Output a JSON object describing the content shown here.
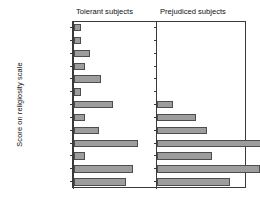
{
  "figure": {
    "ylabel": "Score on religiosity scale",
    "panels": [
      {
        "name": "tolerant",
        "title": "Tolerant subjects"
      },
      {
        "name": "prejudiced",
        "title": "Prejudiced subjects"
      }
    ],
    "bar_fill": "#9d9d9d",
    "bar_edge": "#4d4d4d",
    "frame_color": "#3a3a3a"
  },
  "chart_data": {
    "type": "bar",
    "orientation": "horizontal",
    "title": "",
    "subtitle": "",
    "xlabel": "",
    "ylabel": "Score on religiosity scale",
    "grid": false,
    "legend": "none",
    "layout": "two side-by-side panels sharing one y axis, bars extend rightward from each panel baseline",
    "categories": [
      "-19/-17",
      "-16/-14",
      "-13/-11",
      "-10/-8",
      "-7/-5",
      "-4/-2",
      "-1/+1",
      "2/4",
      "5/7",
      "8/10",
      "11/13",
      "14/16",
      "17/19"
    ],
    "xlim": [
      0,
      36
    ],
    "series": [
      {
        "name": "Tolerant subjects",
        "values": [
          3,
          3,
          7,
          5,
          12,
          3,
          17,
          5,
          11,
          28,
          5,
          26,
          23
        ]
      },
      {
        "name": "Prejudiced subjects",
        "values": [
          0,
          0,
          0,
          0,
          0,
          0,
          7,
          17,
          22,
          46,
          24,
          45,
          32
        ]
      }
    ]
  }
}
